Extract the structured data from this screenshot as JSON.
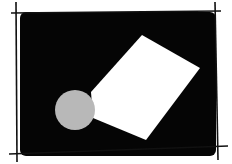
{
  "illustration": {
    "subject": "image-placeholder-sketch",
    "colors": {
      "background": "#ffffff",
      "frame_fill": "#050505",
      "paper": "#ffffff",
      "circle": "#b8b8b8",
      "lines": "#111111"
    }
  }
}
